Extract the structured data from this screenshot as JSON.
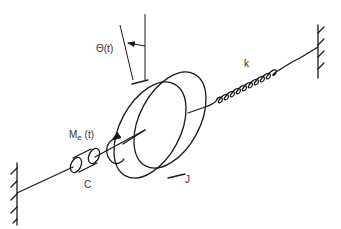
{
  "diagram": {
    "title": "",
    "type": "torsional mass-spring-damper system",
    "labels": {
      "angle": "Θ(t)",
      "torque_main": "M",
      "torque_sub": "e",
      "torque_arg": " (t)",
      "damper": "C",
      "inertia": "J",
      "spring": "k"
    },
    "components": [
      {
        "id": "left-wall",
        "kind": "fixed support"
      },
      {
        "id": "damper",
        "kind": "rotary damper",
        "label": "C"
      },
      {
        "id": "shaft",
        "kind": "shaft"
      },
      {
        "id": "disk",
        "kind": "inertia disk",
        "label": "J"
      },
      {
        "id": "spring",
        "kind": "torsional spring",
        "label": "k"
      },
      {
        "id": "right-wall",
        "kind": "fixed support"
      }
    ],
    "colors": {
      "stroke": "#1a1a1a",
      "text": "#333333",
      "background": "#ffffff"
    }
  }
}
